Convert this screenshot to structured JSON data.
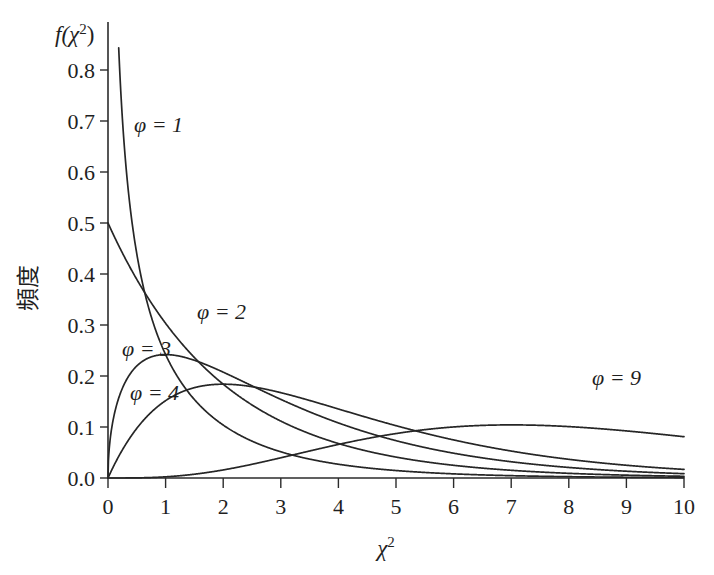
{
  "chart_data": {
    "type": "line",
    "title": "",
    "subtitle": "",
    "xlabel": "χ²",
    "ylabel": "頻度",
    "ylabel_secondary": "f(χ²)",
    "xlim": [
      0,
      10
    ],
    "ylim": [
      0.0,
      0.85
    ],
    "grid": false,
    "legend_position": "inline-annotations",
    "x_ticks": [
      0,
      1,
      2,
      3,
      4,
      5,
      6,
      7,
      8,
      9,
      10
    ],
    "x_tick_labels": [
      "0",
      "1",
      "2",
      "3",
      "4",
      "5",
      "6",
      "7",
      "8",
      "9",
      "10"
    ],
    "y_ticks": [
      0.0,
      0.1,
      0.2,
      0.3,
      0.4,
      0.5,
      0.6,
      0.7,
      0.8
    ],
    "y_tick_labels": [
      "0.0",
      "0.1",
      "0.2",
      "0.3",
      "0.4",
      "0.5",
      "0.6",
      "0.7",
      "0.8"
    ],
    "x": [
      0.0,
      0.1,
      0.2,
      0.3,
      0.4,
      0.5,
      0.6,
      0.7,
      0.8,
      0.9,
      1.0,
      1.2,
      1.4,
      1.6,
      1.8,
      2.0,
      2.25,
      2.5,
      2.75,
      3.0,
      3.5,
      4.0,
      4.5,
      5.0,
      5.5,
      6.0,
      6.5,
      7.0,
      7.5,
      8.0,
      8.5,
      9.0,
      9.5,
      10.0
    ],
    "series": [
      {
        "name": "φ = 1",
        "label": "φ = 1",
        "df": 1,
        "label_xy": [
          0.45,
          0.715
        ],
        "clip_top": 0.85,
        "values": [
          null,
          1.2,
          0.807,
          0.628,
          0.516,
          0.439,
          0.383,
          0.339,
          0.303,
          0.274,
          0.242,
          0.198,
          0.163,
          0.136,
          0.113,
          0.094,
          0.075,
          0.06,
          0.048,
          0.039,
          0.025,
          0.016,
          0.011,
          0.0073,
          0.0048,
          0.0032,
          0.0021,
          0.0014,
          0.0009,
          0.0006,
          0.0004,
          0.0003,
          0.0002,
          0.0001
        ]
      },
      {
        "name": "φ = 2",
        "label": "φ = 2",
        "df": 2,
        "label_xy": [
          1.62,
          0.325
        ],
        "values": [
          0.5,
          0.476,
          0.452,
          0.43,
          0.409,
          0.39,
          0.37,
          0.352,
          0.335,
          0.319,
          0.303,
          0.274,
          0.248,
          0.225,
          0.203,
          0.184,
          0.162,
          0.143,
          0.126,
          0.112,
          0.087,
          0.068,
          0.053,
          0.041,
          0.032,
          0.025,
          0.019,
          0.015,
          0.012,
          0.009,
          0.007,
          0.006,
          0.004,
          0.003
        ]
      },
      {
        "name": "φ = 3",
        "label": "φ = 3",
        "df": 3,
        "label_xy": [
          0.42,
          0.252
        ],
        "peak_x": 1.0,
        "peak_y": 0.242,
        "values": [
          0.0,
          0.12,
          0.161,
          0.186,
          0.202,
          0.214,
          0.221,
          0.226,
          0.229,
          0.23,
          0.242,
          0.2256,
          0.2082,
          0.1899,
          0.1718,
          0.1542,
          0.1336,
          0.1152,
          0.0988,
          0.0843,
          0.0607,
          0.043,
          0.0301,
          0.0209,
          0.0144,
          0.0099,
          0.0067,
          0.0045,
          0.003,
          0.002,
          0.0014,
          0.0009,
          0.0006,
          0.0004
        ]
      },
      {
        "name": "φ = 4",
        "label": "φ = 4",
        "df": 4,
        "label_xy": [
          0.55,
          0.178
        ],
        "peak_x": 2.0,
        "peak_y": 0.184,
        "values": [
          0.0,
          0.024,
          0.045,
          0.065,
          0.082,
          0.097,
          0.111,
          0.123,
          0.134,
          0.143,
          0.152,
          0.165,
          0.174,
          0.18,
          0.183,
          0.184,
          0.1821,
          0.1791,
          0.174,
          0.1673,
          0.1521,
          0.1353,
          0.1186,
          0.1026,
          0.0878,
          0.0747,
          0.0629,
          0.0527,
          0.0438,
          0.0366,
          0.0302,
          0.025,
          0.0205,
          0.0168
        ]
      },
      {
        "name": "φ = 9",
        "label": "φ = 9",
        "df": 9,
        "label_xy": [
          8.4,
          0.155
        ],
        "peak_x": 7.0,
        "peak_y": 0.1014,
        "values": [
          0.0,
          2e-05,
          0.00011,
          0.0003,
          0.00061,
          0.00105,
          0.00163,
          0.00235,
          0.00321,
          0.0042,
          0.00531,
          0.00787,
          0.01083,
          0.01409,
          0.01757,
          0.02119,
          0.02581,
          0.03038,
          0.0348,
          0.03899,
          0.04649,
          0.05264,
          0.0575,
          0.06116,
          0.06377,
          0.06546,
          0.06638,
          0.06664,
          0.06637,
          0.06566,
          0.06461,
          0.0633,
          0.06178,
          0.06012
        ]
      }
    ],
    "annotations": [
      {
        "text": "φ = 1",
        "x": 0.45,
        "y": 0.715
      },
      {
        "text": "φ = 2",
        "x": 1.62,
        "y": 0.325
      },
      {
        "text": "φ = 3",
        "x": 0.42,
        "y": 0.252
      },
      {
        "text": "φ = 4",
        "x": 0.55,
        "y": 0.178
      },
      {
        "text": "φ = 9",
        "x": 8.4,
        "y": 0.155
      }
    ]
  },
  "labels": {
    "y_axis_function": "f(χ²)",
    "y_axis_function_base": "f(",
    "y_axis_function_chi": "χ",
    "y_axis_function_sup": "2",
    "y_axis_function_close": ")",
    "y_axis_japanese": "頻度",
    "x_axis_chi": "χ",
    "x_axis_sup": "2",
    "ytick_0": "0.0",
    "ytick_1": "0.1",
    "ytick_2": "0.2",
    "ytick_3": "0.3",
    "ytick_4": "0.4",
    "ytick_5": "0.5",
    "ytick_6": "0.6",
    "ytick_7": "0.7",
    "ytick_8": "0.8",
    "xtick_0": "0",
    "xtick_1": "1",
    "xtick_2": "2",
    "xtick_3": "3",
    "xtick_4": "4",
    "xtick_5": "5",
    "xtick_6": "6",
    "xtick_7": "7",
    "xtick_8": "8",
    "xtick_9": "9",
    "xtick_10": "10",
    "curve_1": "φ = 1",
    "curve_2": "φ = 2",
    "curve_3": "φ = 3",
    "curve_4": "φ = 4",
    "curve_9": "φ = 9",
    "phi": "ϕ",
    "eq1": " = 1",
    "eq2": " = 2",
    "eq3": " = 3",
    "eq4": " = 4",
    "eq9": " = 9"
  },
  "colors": {
    "background": "#ffffff",
    "axis": "#2b2b2b",
    "curve": "#262626",
    "text": "#1f1f1f"
  }
}
